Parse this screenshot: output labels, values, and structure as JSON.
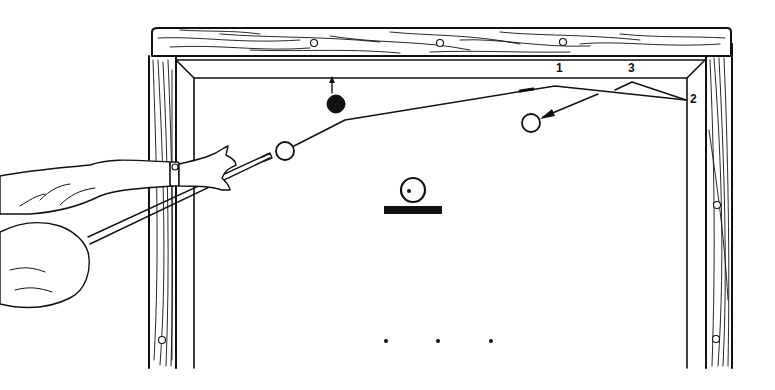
{
  "diagram": {
    "type": "billiards-bank-shot-illustration",
    "colors": {
      "ink": "#111111",
      "paper": "#ffffff",
      "ball_black": "#111111"
    },
    "rail_labels": [
      {
        "id": "1",
        "text": "1",
        "x": 556,
        "y": 62
      },
      {
        "id": "3",
        "text": "3",
        "x": 628,
        "y": 62
      },
      {
        "id": "2",
        "text": "2",
        "x": 690,
        "y": 93
      }
    ],
    "balls": {
      "cue_ball": {
        "x": 285,
        "y": 151,
        "r": 9,
        "fill": "white"
      },
      "object_ball_black": {
        "x": 336,
        "y": 104,
        "r": 9,
        "fill": "black"
      },
      "object_ball_white": {
        "x": 531,
        "y": 123,
        "r": 9,
        "fill": "white"
      },
      "spot_ball": {
        "x": 413,
        "y": 190,
        "r": 12,
        "fill": "white"
      }
    },
    "top_rail_diamonds": [
      {
        "x": 314,
        "y": 43
      },
      {
        "x": 440,
        "y": 43
      },
      {
        "x": 563,
        "y": 42
      }
    ],
    "side_rail_diamonds": [
      {
        "x": 162,
        "y": 340
      },
      {
        "x": 717,
        "y": 205
      },
      {
        "x": 716,
        "y": 339
      }
    ],
    "foot_spots": [
      {
        "x": 386,
        "y": 341
      },
      {
        "x": 438,
        "y": 341
      },
      {
        "x": 491,
        "y": 341
      }
    ]
  }
}
